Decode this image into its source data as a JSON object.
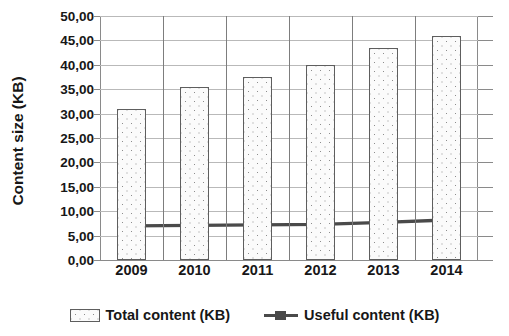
{
  "chart_data": {
    "type": "bar",
    "title": "",
    "xlabel": "",
    "ylabel": "Content size (KB)",
    "categories": [
      "2009",
      "2010",
      "2011",
      "2012",
      "2013",
      "2014"
    ],
    "ylim": [
      0,
      50
    ],
    "ytick_step": 5,
    "ytick_labels": [
      "50,00",
      "45,00",
      "40,00",
      "35,00",
      "30,00",
      "25,00",
      "20,00",
      "15,00",
      "10,00",
      "5,00",
      "0,00"
    ],
    "ytick_values": [
      50,
      45,
      40,
      35,
      30,
      25,
      20,
      15,
      10,
      5,
      0
    ],
    "grid": true,
    "legend_position": "bottom",
    "decimal_separator": ",",
    "series": [
      {
        "name": "Total content (KB)",
        "type": "bar",
        "values": [
          31.0,
          35.5,
          37.5,
          40.0,
          43.5,
          46.0
        ],
        "fill": "dotted-pattern",
        "fill_color": "#fbfbfb",
        "border_color": "#5e5e5e"
      },
      {
        "name": "Useful content (KB)",
        "type": "line",
        "values": [
          7.0,
          7.1,
          7.2,
          7.3,
          7.7,
          8.2
        ],
        "line_color": "#4a4a4a",
        "marker": "square"
      }
    ]
  },
  "legend": {
    "entries": [
      {
        "label": "Total content (KB)",
        "icon": "bar-swatch-icon"
      },
      {
        "label": "Useful content (KB)",
        "icon": "line-marker-swatch-icon"
      }
    ]
  },
  "colors": {
    "gridline": "#b9b9b9",
    "axis": "#8a8a8a",
    "text": "#171717",
    "bar_border": "#5e5e5e",
    "bar_fill": "#fbfbfb",
    "line": "#4a4a4a",
    "background": "#ffffff"
  }
}
